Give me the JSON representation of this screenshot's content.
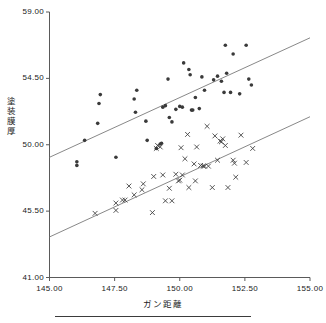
{
  "chart_data": {
    "type": "scatter",
    "title": "",
    "xlabel": "ガン距離",
    "ylabel": "塗装膜厚",
    "xlim": [
      145.0,
      155.0
    ],
    "ylim": [
      41.0,
      59.0
    ],
    "xticks": [
      "145.00",
      "147.50",
      "150.00",
      "152.50",
      "155.00"
    ],
    "xtick_values": [
      145.0,
      147.5,
      150.0,
      152.5,
      155.0
    ],
    "yticks": [
      "41.00",
      "45.50",
      "50.00",
      "54.50",
      "59.00"
    ],
    "ytick_values": [
      41.0,
      45.5,
      50.0,
      54.5,
      59.0
    ],
    "grid": false,
    "legend": "none",
    "series": [
      {
        "name": "series-dot",
        "marker": "filled-circle",
        "color": "#3a3a3a",
        "points": [
          [
            146.05,
            48.85
          ],
          [
            146.05,
            48.6
          ],
          [
            146.35,
            50.3
          ],
          [
            146.85,
            51.45
          ],
          [
            146.9,
            52.8
          ],
          [
            146.95,
            53.4
          ],
          [
            147.55,
            49.15
          ],
          [
            148.25,
            53.1
          ],
          [
            148.3,
            52.2
          ],
          [
            148.35,
            53.7
          ],
          [
            148.7,
            51.6
          ],
          [
            148.75,
            50.3
          ],
          [
            149.1,
            49.75
          ],
          [
            149.25,
            50.05
          ],
          [
            149.3,
            50.1
          ],
          [
            149.35,
            52.55
          ],
          [
            149.45,
            52.65
          ],
          [
            149.55,
            54.45
          ],
          [
            149.6,
            51.85
          ],
          [
            149.7,
            51.55
          ],
          [
            149.85,
            52.4
          ],
          [
            150.0,
            52.6
          ],
          [
            150.1,
            52.55
          ],
          [
            150.15,
            55.55
          ],
          [
            150.35,
            55.1
          ],
          [
            150.4,
            54.75
          ],
          [
            150.45,
            52.35
          ],
          [
            150.5,
            52.35
          ],
          [
            150.6,
            53.2
          ],
          [
            150.75,
            52.45
          ],
          [
            150.85,
            54.6
          ],
          [
            150.95,
            53.7
          ],
          [
            151.3,
            54.4
          ],
          [
            151.45,
            54.65
          ],
          [
            151.6,
            54.3
          ],
          [
            151.7,
            53.55
          ],
          [
            151.75,
            56.75
          ],
          [
            151.8,
            54.85
          ],
          [
            151.95,
            53.55
          ],
          [
            152.05,
            56.15
          ],
          [
            152.3,
            53.45
          ],
          [
            152.55,
            56.75
          ],
          [
            152.65,
            54.45
          ],
          [
            152.75,
            54.05
          ]
        ]
      },
      {
        "name": "series-cross",
        "marker": "x-cross",
        "color": "#3a3a3a",
        "points": [
          [
            146.75,
            45.35
          ],
          [
            147.55,
            46.05
          ],
          [
            147.55,
            45.55
          ],
          [
            147.8,
            46.25
          ],
          [
            147.9,
            46.25
          ],
          [
            148.05,
            47.2
          ],
          [
            148.25,
            46.6
          ],
          [
            148.55,
            46.95
          ],
          [
            148.6,
            47.35
          ],
          [
            148.95,
            45.4
          ],
          [
            149.0,
            47.85
          ],
          [
            149.1,
            49.75
          ],
          [
            149.15,
            49.95
          ],
          [
            149.25,
            49.85
          ],
          [
            149.35,
            47.95
          ],
          [
            149.45,
            46.2
          ],
          [
            149.6,
            47.05
          ],
          [
            149.7,
            46.2
          ],
          [
            149.85,
            48.0
          ],
          [
            149.95,
            47.55
          ],
          [
            150.0,
            47.6
          ],
          [
            150.05,
            49.8
          ],
          [
            150.1,
            47.95
          ],
          [
            150.2,
            49.05
          ],
          [
            150.3,
            50.7
          ],
          [
            150.35,
            47.1
          ],
          [
            150.55,
            48.7
          ],
          [
            150.6,
            47.55
          ],
          [
            150.65,
            49.85
          ],
          [
            150.8,
            48.6
          ],
          [
            150.9,
            48.55
          ],
          [
            150.95,
            48.55
          ],
          [
            151.05,
            51.25
          ],
          [
            151.1,
            48.55
          ],
          [
            151.25,
            47.1
          ],
          [
            151.35,
            50.6
          ],
          [
            151.45,
            48.95
          ],
          [
            151.55,
            50.25
          ],
          [
            151.6,
            50.2
          ],
          [
            151.65,
            50.4
          ],
          [
            151.75,
            49.95
          ],
          [
            151.85,
            47.1
          ],
          [
            152.05,
            48.95
          ],
          [
            152.1,
            48.75
          ],
          [
            152.15,
            47.8
          ],
          [
            152.35,
            50.65
          ],
          [
            152.55,
            48.8
          ],
          [
            152.8,
            49.75
          ]
        ]
      }
    ],
    "fit_lines": [
      {
        "name": "fit-line-dot",
        "for_series": "series-dot",
        "color": "#7a7a7a",
        "x0": 145.0,
        "y0": 49.15,
        "x1": 155.0,
        "y1": 57.25
      },
      {
        "name": "fit-line-cross",
        "for_series": "series-cross",
        "color": "#7a7a7a",
        "x0": 145.0,
        "y0": 43.75,
        "x1": 155.0,
        "y1": 51.9
      }
    ]
  },
  "axes": {
    "x_title": "ガン距離",
    "y_title_chars": [
      "塗",
      "装",
      "膜",
      "厚"
    ],
    "x_tick_labels": [
      "145.00",
      "147.50",
      "150.00",
      "152.50",
      "155.00"
    ],
    "y_tick_labels": [
      "59.00",
      "54.50",
      "50.00",
      "45.50",
      "41.00"
    ]
  }
}
